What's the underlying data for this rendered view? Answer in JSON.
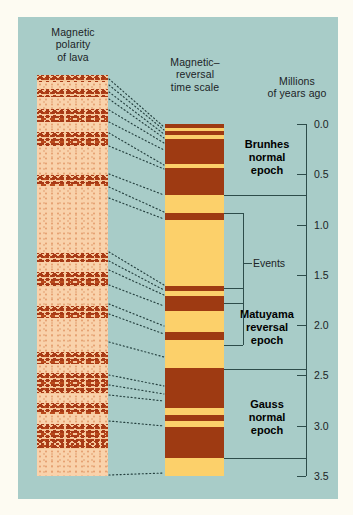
{
  "figure": {
    "background_color": "#a8ccc8",
    "page_background_color": "#fdfbf2"
  },
  "headers": {
    "lava_column": "Magnetic\npolarity\nof lava",
    "timescale_column": "Magnetic–\nreversal\ntime scale",
    "axis": "Millions\nof years ago"
  },
  "epochs": [
    {
      "name": "brunhes",
      "label": "Brunhes\nnormal\nepoch",
      "start_ma": 0.0,
      "end_ma": 0.7
    },
    {
      "name": "matuyama",
      "label": "Matuyama\nreversal\nepoch",
      "start_ma": 0.7,
      "end_ma": 2.43
    },
    {
      "name": "gauss",
      "label": "Gauss\nnormal\nepoch",
      "start_ma": 2.43,
      "end_ma": 3.32
    }
  ],
  "events_label": "Events",
  "axis": {
    "min_ma": 0.0,
    "max_ma": 3.5,
    "ticks": [
      "0.0",
      "0.5",
      "1.0",
      "1.5",
      "2.0",
      "2.5",
      "3.0",
      "3.5"
    ],
    "tick_values": [
      0.0,
      0.5,
      1.0,
      1.5,
      2.0,
      2.5,
      3.0,
      3.5
    ]
  },
  "chart_data": {
    "type": "bar",
    "xlabel": "",
    "ylabel": "Millions of years ago",
    "ylim": [
      0.0,
      3.5
    ],
    "polarity_colors": {
      "normal": "#fcd06a",
      "reversed": "#9e3a12"
    },
    "timescale_bands_ma": [
      {
        "from": 0.0,
        "to": 0.04,
        "polarity": "reversed"
      },
      {
        "from": 0.04,
        "to": 0.07,
        "polarity": "normal"
      },
      {
        "from": 0.07,
        "to": 0.11,
        "polarity": "reversed"
      },
      {
        "from": 0.11,
        "to": 0.15,
        "polarity": "normal"
      },
      {
        "from": 0.15,
        "to": 0.4,
        "polarity": "reversed"
      },
      {
        "from": 0.4,
        "to": 0.44,
        "polarity": "normal"
      },
      {
        "from": 0.44,
        "to": 0.71,
        "polarity": "reversed"
      },
      {
        "from": 0.71,
        "to": 0.88,
        "polarity": "normal"
      },
      {
        "from": 0.88,
        "to": 0.95,
        "polarity": "reversed"
      },
      {
        "from": 0.95,
        "to": 1.61,
        "polarity": "normal"
      },
      {
        "from": 1.61,
        "to": 1.66,
        "polarity": "reversed"
      },
      {
        "from": 1.66,
        "to": 1.71,
        "polarity": "normal"
      },
      {
        "from": 1.71,
        "to": 1.86,
        "polarity": "reversed"
      },
      {
        "from": 1.86,
        "to": 2.07,
        "polarity": "normal"
      },
      {
        "from": 2.07,
        "to": 2.15,
        "polarity": "reversed"
      },
      {
        "from": 2.15,
        "to": 2.43,
        "polarity": "normal"
      },
      {
        "from": 2.43,
        "to": 2.82,
        "polarity": "reversed"
      },
      {
        "from": 2.82,
        "to": 2.89,
        "polarity": "normal"
      },
      {
        "from": 2.89,
        "to": 2.95,
        "polarity": "reversed"
      },
      {
        "from": 2.95,
        "to": 3.01,
        "polarity": "normal"
      },
      {
        "from": 3.01,
        "to": 3.32,
        "polarity": "reversed"
      },
      {
        "from": 3.32,
        "to": 3.5,
        "polarity": "normal"
      }
    ],
    "lava_bands_ma": [
      {
        "from": 0.0,
        "to": 0.06,
        "polarity": "reversed"
      },
      {
        "from": 0.06,
        "to": 0.12,
        "polarity": "normal"
      },
      {
        "from": 0.12,
        "to": 0.19,
        "polarity": "reversed"
      },
      {
        "from": 0.19,
        "to": 0.3,
        "polarity": "normal"
      },
      {
        "from": 0.3,
        "to": 0.41,
        "polarity": "reversed"
      },
      {
        "from": 0.41,
        "to": 0.5,
        "polarity": "normal"
      },
      {
        "from": 0.5,
        "to": 0.62,
        "polarity": "reversed"
      },
      {
        "from": 0.62,
        "to": 0.87,
        "polarity": "normal"
      },
      {
        "from": 0.87,
        "to": 0.97,
        "polarity": "reversed"
      },
      {
        "from": 0.97,
        "to": 1.55,
        "polarity": "normal"
      },
      {
        "from": 1.55,
        "to": 1.63,
        "polarity": "reversed"
      },
      {
        "from": 1.63,
        "to": 1.72,
        "polarity": "normal"
      },
      {
        "from": 1.72,
        "to": 1.85,
        "polarity": "reversed"
      },
      {
        "from": 1.85,
        "to": 2.02,
        "polarity": "normal"
      },
      {
        "from": 2.02,
        "to": 2.12,
        "polarity": "reversed"
      },
      {
        "from": 2.12,
        "to": 2.42,
        "polarity": "normal"
      },
      {
        "from": 2.42,
        "to": 2.52,
        "polarity": "reversed"
      },
      {
        "from": 2.52,
        "to": 2.6,
        "polarity": "normal"
      },
      {
        "from": 2.6,
        "to": 2.78,
        "polarity": "reversed"
      },
      {
        "from": 2.78,
        "to": 2.86,
        "polarity": "normal"
      },
      {
        "from": 2.86,
        "to": 2.96,
        "polarity": "reversed"
      },
      {
        "from": 2.96,
        "to": 3.05,
        "polarity": "normal"
      },
      {
        "from": 3.05,
        "to": 3.26,
        "polarity": "reversed"
      },
      {
        "from": 3.26,
        "to": 3.5,
        "polarity": "normal"
      }
    ]
  }
}
